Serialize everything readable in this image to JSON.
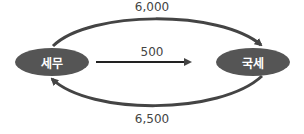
{
  "nodes": {
    "left": {
      "label": "세무"
    },
    "right": {
      "label": "국세"
    }
  },
  "edges": {
    "top": {
      "label": "6,000",
      "from": "세무",
      "to": "국세"
    },
    "middle": {
      "label": "500",
      "from": "세무",
      "to": "국세"
    },
    "bottom": {
      "label": "6,500",
      "from": "국세",
      "to": "세무"
    }
  },
  "colors": {
    "node": "#555555",
    "arrow": "#444444",
    "text": "#444444"
  }
}
